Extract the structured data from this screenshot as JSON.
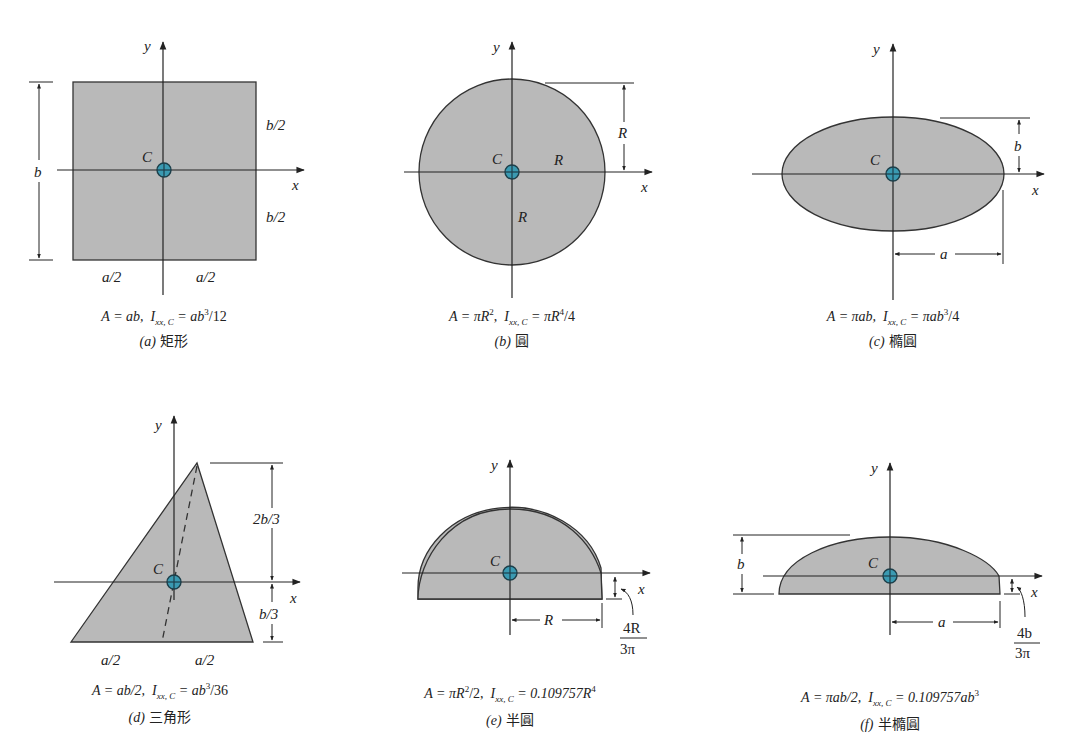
{
  "colors": {
    "fill": "#b9b9b9",
    "stroke": "#333333",
    "centroid": "#3a9ab2",
    "background": "#ffffff"
  },
  "centroid_label": "C",
  "axes": {
    "x": "x",
    "y": "y"
  },
  "shapes": [
    {
      "id": "a",
      "tag": "(a)",
      "name": "矩形",
      "dims": [
        "b",
        "b/2",
        "b/2",
        "a/2",
        "a/2"
      ],
      "formula": {
        "A": "A = ab,",
        "I_prefix": "I",
        "I_sub": "xx, C",
        "I_rhs_pre": " = ab",
        "I_sup": "3",
        "I_rhs_post": "/12"
      }
    },
    {
      "id": "b",
      "tag": "(b)",
      "name": "圓",
      "dims": [
        "R",
        "R",
        "R"
      ],
      "formula": {
        "A_pre": "A = πR",
        "A_sup": "2",
        "A_post": ",",
        "I_prefix": "I",
        "I_sub": "xx, C",
        "I_rhs_pre": " = πR",
        "I_sup": "4",
        "I_rhs_post": "/4"
      }
    },
    {
      "id": "c",
      "tag": "(c)",
      "name": "橢圓",
      "dims": [
        "b",
        "a"
      ],
      "formula": {
        "A": "A = πab,",
        "I_prefix": "I",
        "I_sub": "xx, C",
        "I_rhs_pre": " = πab",
        "I_sup": "3",
        "I_rhs_post": "/4"
      }
    },
    {
      "id": "d",
      "tag": "(d)",
      "name": "三角形",
      "dims": [
        "2b/3",
        "b/3",
        "a/2",
        "a/2"
      ],
      "formula": {
        "A": "A = ab/2,",
        "I_prefix": "I",
        "I_sub": "xx, C",
        "I_rhs_pre": " = ab",
        "I_sup": "3",
        "I_rhs_post": "/36"
      }
    },
    {
      "id": "e",
      "tag": "(e)",
      "name": "半圓",
      "dims": [
        "R"
      ],
      "offset": {
        "num": "4R",
        "den": "3π"
      },
      "formula": {
        "A_pre": "A = πR",
        "A_sup": "2",
        "A_post": "/2,",
        "I_prefix": "I",
        "I_sub": "xx, C",
        "I_rhs_pre": " = 0.109757R",
        "I_sup": "4",
        "I_rhs_post": ""
      }
    },
    {
      "id": "f",
      "tag": "(f)",
      "name": "半橢圓",
      "dims": [
        "b",
        "a"
      ],
      "offset": {
        "num": "4b",
        "den": "3π"
      },
      "formula": {
        "A": "A = πab/2,",
        "I_prefix": "I",
        "I_sub": "xx, C",
        "I_rhs_pre": " = 0.109757ab",
        "I_sup": "3",
        "I_rhs_post": ""
      }
    }
  ]
}
